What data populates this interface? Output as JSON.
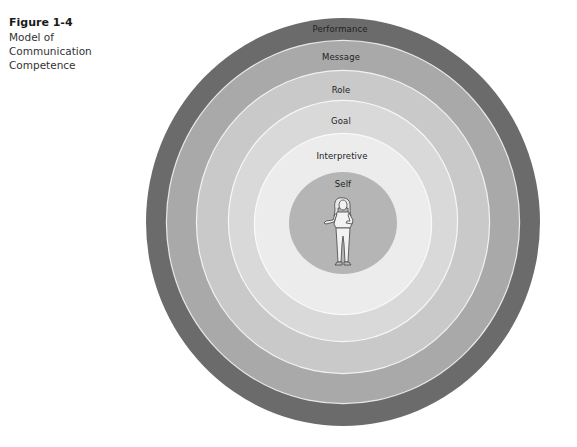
{
  "caption": {
    "figure_number": "Figure 1-4",
    "title": "Model of Communication Competence"
  },
  "diagram": {
    "type": "concentric-circles",
    "center": {
      "x": 343,
      "y": 222
    },
    "rings": [
      {
        "name": "Performance",
        "order": 1,
        "rx": 197,
        "ry": 204,
        "color": "#6b6b6b",
        "label_y": 29
      },
      {
        "name": "Message",
        "order": 2,
        "rx": 176,
        "ry": 181,
        "color": "#a9a9a9",
        "label_y": 57
      },
      {
        "name": "Role",
        "order": 3,
        "rx": 146,
        "ry": 151,
        "color": "#c9c9c9",
        "label_y": 90
      },
      {
        "name": "Goal",
        "order": 4,
        "rx": 114,
        "ry": 120,
        "color": "#d9d9d9",
        "label_y": 121
      },
      {
        "name": "Interpretive",
        "order": 5,
        "rx": 88,
        "ry": 89,
        "color": "#ececec",
        "label_y": 156
      },
      {
        "name": "Self",
        "order": 6,
        "rx": 54,
        "ry": 51,
        "color": "#b5b5b5",
        "label_y": 184
      }
    ],
    "center_figure": "person-illustration"
  },
  "labels": {
    "performance": "Performance",
    "message": "Message",
    "role": "Role",
    "goal": "Goal",
    "interpretive": "Interpretive",
    "self": "Self"
  }
}
